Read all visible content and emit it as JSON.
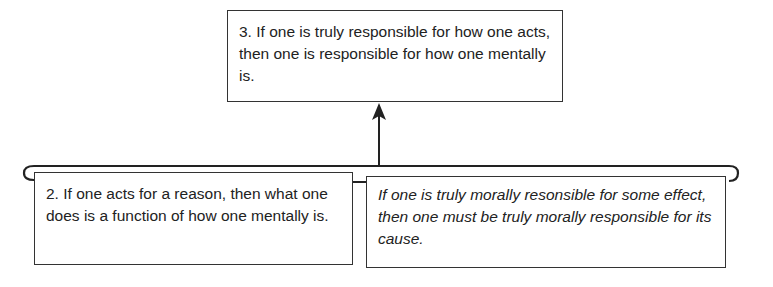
{
  "diagram": {
    "type": "argument-map",
    "conclusion": {
      "id": "3",
      "text": "3. If one is truly responsible for how one acts, then one is responsible for how one mentally is."
    },
    "premises": [
      {
        "id": "2",
        "text": "2. If one acts for a reason, then what one does is a function of how one mentally is.",
        "style": "normal"
      },
      {
        "id": "unnumbered",
        "text": "If one is truly morally resonsible for some effect, then one must be truly morally responsible for its cause.",
        "style": "italic"
      }
    ],
    "relations": [
      {
        "from": [
          "2",
          "unnumbered"
        ],
        "to": "3",
        "kind": "linked-support-arrow"
      }
    ],
    "colors": {
      "line": "#222222",
      "box_border": "#333333",
      "background": "#ffffff",
      "text": "#222222"
    }
  }
}
